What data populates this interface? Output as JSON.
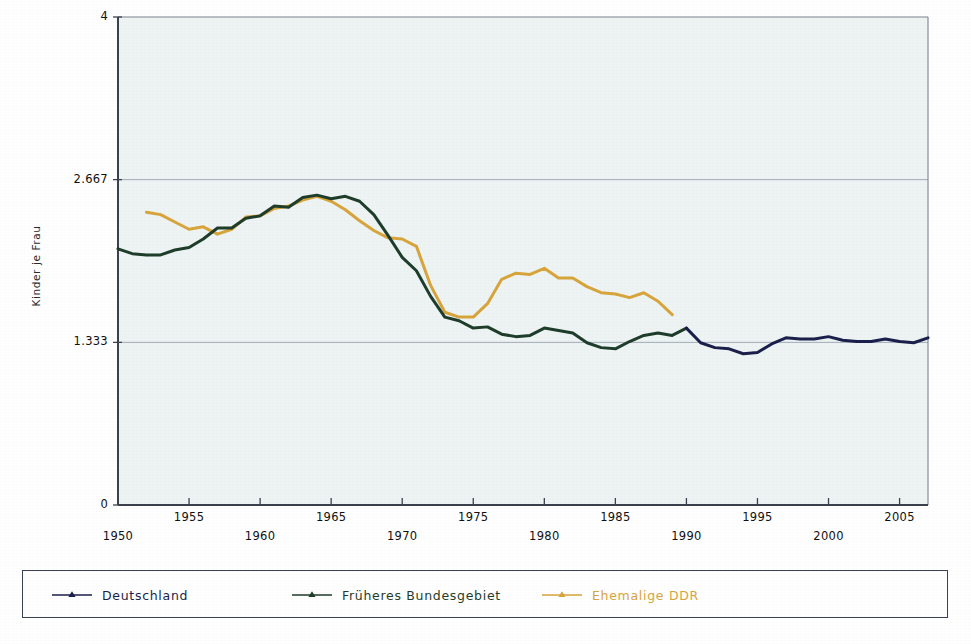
{
  "chart_data": {
    "type": "line",
    "title": "",
    "xlabel": "",
    "ylabel": "Kinder je Frau",
    "xlim": [
      1950,
      2007
    ],
    "ylim": [
      0,
      4
    ],
    "yticks": [
      "0",
      "1.333",
      "2.667",
      "4"
    ],
    "ytick_values": [
      0,
      1.333,
      2.667,
      4
    ],
    "xticks": [
      "1950",
      "1955",
      "1960",
      "1965",
      "1970",
      "1975",
      "1980",
      "1985",
      "1990",
      "1995",
      "2000",
      "2005"
    ],
    "xtick_values": [
      1950,
      1955,
      1960,
      1965,
      1970,
      1975,
      1980,
      1985,
      1990,
      1995,
      2000,
      2005
    ],
    "grid": "horizontal",
    "legend_position": "bottom",
    "plot_background": "#eef4f3",
    "series": [
      {
        "name": "Deutschland",
        "color": "#1b1f4b",
        "x": [
          1990,
          1991,
          1992,
          1993,
          1994,
          1995,
          1996,
          1997,
          1998,
          1999,
          2000,
          2001,
          2002,
          2003,
          2004,
          2005,
          2006,
          2007
        ],
        "values": [
          1.45,
          1.33,
          1.29,
          1.28,
          1.24,
          1.25,
          1.32,
          1.37,
          1.36,
          1.36,
          1.38,
          1.35,
          1.34,
          1.34,
          1.36,
          1.34,
          1.33,
          1.37
        ]
      },
      {
        "name": "Früheres Bundesgebiet",
        "color": "#1f3d2b",
        "x": [
          1950,
          1951,
          1952,
          1953,
          1954,
          1955,
          1956,
          1957,
          1958,
          1959,
          1960,
          1961,
          1962,
          1963,
          1964,
          1965,
          1966,
          1967,
          1968,
          1969,
          1970,
          1971,
          1972,
          1973,
          1974,
          1975,
          1976,
          1977,
          1978,
          1979,
          1980,
          1981,
          1982,
          1983,
          1984,
          1985,
          1986,
          1987,
          1988,
          1989,
          1990
        ],
        "values": [
          2.1,
          2.06,
          2.05,
          2.05,
          2.09,
          2.11,
          2.18,
          2.27,
          2.27,
          2.35,
          2.37,
          2.45,
          2.44,
          2.52,
          2.54,
          2.51,
          2.53,
          2.49,
          2.38,
          2.21,
          2.03,
          1.92,
          1.71,
          1.54,
          1.51,
          1.45,
          1.46,
          1.4,
          1.38,
          1.39,
          1.45,
          1.43,
          1.41,
          1.33,
          1.29,
          1.28,
          1.34,
          1.39,
          1.41,
          1.39,
          1.45
        ]
      },
      {
        "name": "Ehemalige DDR",
        "color": "#d8a53c",
        "x": [
          1952,
          1953,
          1954,
          1955,
          1956,
          1957,
          1958,
          1959,
          1960,
          1961,
          1962,
          1963,
          1964,
          1965,
          1966,
          1967,
          1968,
          1969,
          1970,
          1971,
          1972,
          1973,
          1974,
          1975,
          1976,
          1977,
          1978,
          1979,
          1980,
          1981,
          1982,
          1983,
          1984,
          1985,
          1986,
          1987,
          1988,
          1989
        ],
        "values": [
          2.4,
          2.38,
          2.32,
          2.26,
          2.28,
          2.22,
          2.26,
          2.36,
          2.37,
          2.43,
          2.45,
          2.5,
          2.53,
          2.49,
          2.42,
          2.33,
          2.25,
          2.19,
          2.18,
          2.12,
          1.8,
          1.58,
          1.54,
          1.54,
          1.65,
          1.85,
          1.9,
          1.89,
          1.94,
          1.86,
          1.86,
          1.79,
          1.74,
          1.73,
          1.7,
          1.74,
          1.67,
          1.56
        ]
      }
    ]
  },
  "legend": {
    "items": [
      {
        "label": "Deutschland",
        "color": "#1b1f4b"
      },
      {
        "label": "Früheres Bundesgebiet",
        "color": "#1f3d2b"
      },
      {
        "label": "Ehemalige DDR",
        "color": "#d8a53c"
      }
    ]
  }
}
